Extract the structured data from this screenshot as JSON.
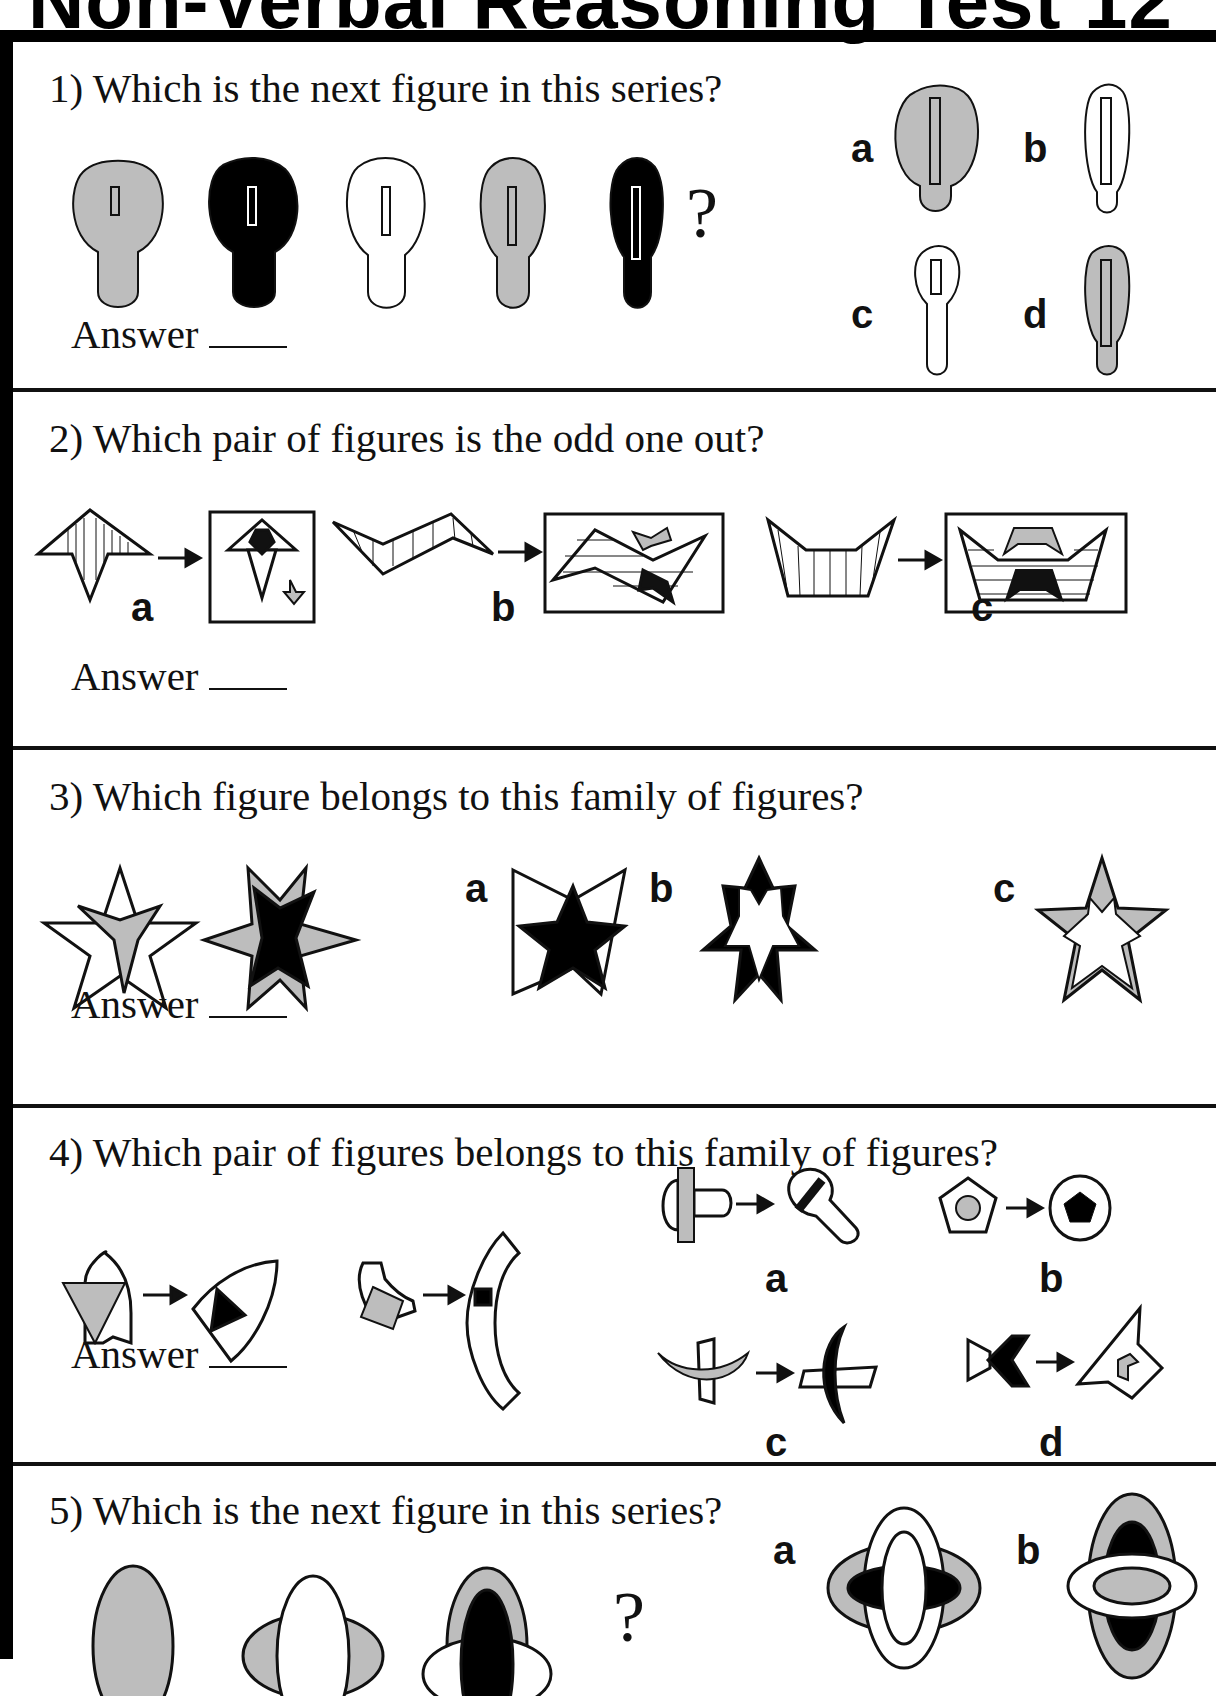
{
  "page": {
    "title": "Non-Verbal Reasoning Test 12",
    "colors": {
      "gray": "#bdbdbd",
      "ink": "#111111",
      "paper": "#ffffff"
    }
  },
  "answer_label": "Answer",
  "questions": [
    {
      "number": 1,
      "text": "1) Which is the next figure in this series?",
      "series": [
        "gray-keyhole-short-slot",
        "black-keyhole",
        "white-keyhole",
        "gray-keyhole-long-slot",
        "black-keyhole-longest-slot"
      ],
      "question_mark": "?",
      "options": [
        {
          "label": "a",
          "figure": "large gray keyhole with long slot"
        },
        {
          "label": "b",
          "figure": "slim white keyhole with long slot"
        },
        {
          "label": "c",
          "figure": "slim white keyhole with short slot"
        },
        {
          "label": "d",
          "figure": "slim gray keyhole with long slot"
        }
      ]
    },
    {
      "number": 2,
      "text": "2) Which pair of figures is the odd one out?",
      "options": [
        {
          "label": "a",
          "figure": "arrow star transformed into boxed triangles"
        },
        {
          "label": "b",
          "figure": "zigzag transformed into boxed zigzag"
        },
        {
          "label": "c",
          "figure": "trough transformed into boxed trough"
        }
      ]
    },
    {
      "number": 3,
      "text": "3) Which figure belongs to this family of figures?",
      "options": [
        {
          "label": "a",
          "figure": "black star over white bowtie"
        },
        {
          "label": "b",
          "figure": "white star inside black star"
        },
        {
          "label": "c",
          "figure": "white star inside gray star"
        }
      ]
    },
    {
      "number": 4,
      "text": "4) Which pair of figures belongs to this family of figures?",
      "options": [
        {
          "label": "a",
          "figure": "bar on keyhole to keyhole with bar"
        },
        {
          "label": "b",
          "figure": "pentagon with circle to circle with pentagon"
        },
        {
          "label": "c",
          "figure": "crescent with trapezoids to crescent"
        },
        {
          "label": "d",
          "figure": "arrow chevron to kite"
        }
      ]
    },
    {
      "number": 5,
      "text": "5) Which is the next figure in this series?",
      "question_mark": "?",
      "options": [
        {
          "label": "a",
          "figure": "nested ellipses gray black white"
        },
        {
          "label": "b",
          "figure": "nested ellipses white gray black"
        }
      ]
    }
  ]
}
